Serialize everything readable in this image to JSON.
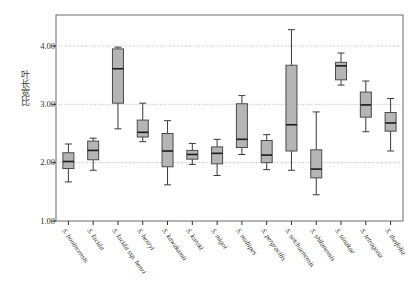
{
  "chart_data": {
    "type": "box",
    "title": "",
    "xlabel": "",
    "ylabel": "叶长宽比",
    "ylim": [
      1.0,
      4.5
    ],
    "yticks": [
      1.0,
      2.0,
      3.0,
      4.0
    ],
    "ytick_labels": [
      "1.00",
      "2.00",
      "3.00",
      "4.00"
    ],
    "grid": "horizontal-dotted",
    "legend": "none",
    "box_facecolor": "#a8a8a8",
    "box_edgecolor": "#4a4a4a",
    "median_color": "#1a1a1a",
    "whisker_color": "#3a3a3a",
    "grid_color": "#b9b9b9",
    "axis_color": "#6b6b6b",
    "categories": [
      "S. bonincensis",
      "S. lucida",
      "S. lucida ssp. henri",
      "S. henryi",
      "S. kawakamii",
      "S. kuroki",
      "S. migoi",
      "S. multipes",
      "S. pergracilis",
      "S. setchuenensis",
      "S. shilanensis",
      "S. tanakae",
      "S. tetragona",
      "S. theifolia"
    ],
    "boxes": [
      {
        "label": "S. bonincensis",
        "whisker_low": 1.67,
        "q1": 1.9,
        "median": 2.02,
        "q3": 2.17,
        "whisker_high": 2.32
      },
      {
        "label": "S. lucida",
        "whisker_low": 1.87,
        "q1": 2.05,
        "median": 2.21,
        "q3": 2.37,
        "whisker_high": 2.42
      },
      {
        "label": "S. lucida ssp. henri",
        "whisker_low": 2.58,
        "q1": 3.02,
        "median": 3.61,
        "q3": 3.95,
        "whisker_high": 3.98
      },
      {
        "label": "S. henryi",
        "whisker_low": 2.36,
        "q1": 2.44,
        "median": 2.52,
        "q3": 2.73,
        "whisker_high": 3.02
      },
      {
        "label": "S. kawakamii",
        "whisker_low": 1.62,
        "q1": 1.93,
        "median": 2.2,
        "q3": 2.5,
        "whisker_high": 2.72
      },
      {
        "label": "S. kuroki",
        "whisker_low": 1.97,
        "q1": 2.06,
        "median": 2.14,
        "q3": 2.21,
        "whisker_high": 2.33
      },
      {
        "label": "S. migoi",
        "whisker_low": 1.78,
        "q1": 1.98,
        "median": 2.16,
        "q3": 2.27,
        "whisker_high": 2.4
      },
      {
        "label": "S. multipes",
        "whisker_low": 2.14,
        "q1": 2.26,
        "median": 2.4,
        "q3": 3.01,
        "whisker_high": 3.15
      },
      {
        "label": "S. pergracilis",
        "whisker_low": 1.88,
        "q1": 2.0,
        "median": 2.13,
        "q3": 2.38,
        "whisker_high": 2.48
      },
      {
        "label": "S. setchuenensis",
        "whisker_low": 1.87,
        "q1": 2.2,
        "median": 2.65,
        "q3": 3.67,
        "whisker_high": 4.28
      },
      {
        "label": "S. shilanensis",
        "whisker_low": 1.45,
        "q1": 1.74,
        "median": 1.89,
        "q3": 2.22,
        "whisker_high": 2.87
      },
      {
        "label": "S. tanakae",
        "whisker_low": 3.33,
        "q1": 3.42,
        "median": 3.66,
        "q3": 3.72,
        "whisker_high": 3.88
      },
      {
        "label": "S. tetragona",
        "whisker_low": 2.53,
        "q1": 2.78,
        "median": 2.99,
        "q3": 3.21,
        "whisker_high": 3.4
      },
      {
        "label": "S. theifolia",
        "whisker_low": 2.2,
        "q1": 2.54,
        "median": 2.68,
        "q3": 2.86,
        "whisker_high": 3.1
      }
    ]
  }
}
